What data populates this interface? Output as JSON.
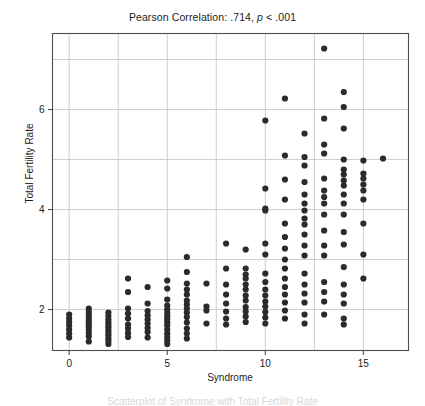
{
  "figure": {
    "title_prefix": "Pearson Correlation: .714, ",
    "title_stat_italic": "p",
    "title_suffix": " < .001",
    "title_full": "Pearson Correlation: .714, p < .001",
    "caption_fragment": "Scatterplot of Syndrome with Total Fertility Rate",
    "background_color": "#ffffff",
    "frame_color": "#4d4d4d",
    "grid_color": "#c9c9c9",
    "point_color": "#2b2b2b"
  },
  "chart_data": {
    "type": "scatter",
    "title": "Pearson Correlation: .714, p < .001",
    "xlabel": "Syndrome",
    "ylabel": "Total Fertility Rate",
    "xlim": [
      -0.85,
      17.3
    ],
    "ylim": [
      1.18,
      7.52
    ],
    "xticks": [
      0,
      5,
      10,
      15
    ],
    "xtick_labels": [
      "0",
      "5",
      "10",
      "15"
    ],
    "yticks": [
      2,
      4,
      6
    ],
    "ytick_labels": [
      "2",
      "4",
      "6"
    ],
    "grid": true,
    "grid_x_minor": [
      2.5,
      7.5,
      12.5
    ],
    "grid_y_minor": [
      3,
      5,
      7
    ],
    "legend": null,
    "pearson_r": 0.714,
    "p_value": "< .001",
    "n_points": 186,
    "marker": "circle",
    "marker_size": 3.1,
    "points": [
      [
        0,
        1.9
      ],
      [
        0,
        1.82
      ],
      [
        0,
        1.75
      ],
      [
        0,
        1.68
      ],
      [
        0,
        1.6
      ],
      [
        0,
        1.52
      ],
      [
        0,
        1.44
      ],
      [
        1,
        2.02
      ],
      [
        1,
        1.95
      ],
      [
        1,
        1.88
      ],
      [
        1,
        1.83
      ],
      [
        1,
        1.77
      ],
      [
        1,
        1.72
      ],
      [
        1,
        1.66
      ],
      [
        1,
        1.6
      ],
      [
        1,
        1.53
      ],
      [
        1,
        1.46
      ],
      [
        1,
        1.36
      ],
      [
        2,
        1.94
      ],
      [
        2,
        1.87
      ],
      [
        2,
        1.8
      ],
      [
        2,
        1.74
      ],
      [
        2,
        1.69
      ],
      [
        2,
        1.64
      ],
      [
        2,
        1.58
      ],
      [
        2,
        1.53
      ],
      [
        2,
        1.48
      ],
      [
        2,
        1.42
      ],
      [
        2,
        1.37
      ],
      [
        2,
        1.31
      ],
      [
        3,
        2.62
      ],
      [
        3,
        2.35
      ],
      [
        3,
        2.02
      ],
      [
        3,
        1.92
      ],
      [
        3,
        1.82
      ],
      [
        3,
        1.7
      ],
      [
        3,
        1.62
      ],
      [
        3,
        1.53
      ],
      [
        3,
        1.45
      ],
      [
        4,
        2.45
      ],
      [
        4,
        2.12
      ],
      [
        4,
        1.97
      ],
      [
        4,
        1.88
      ],
      [
        4,
        1.8
      ],
      [
        4,
        1.72
      ],
      [
        4,
        1.63
      ],
      [
        4,
        1.55
      ],
      [
        4,
        1.44
      ],
      [
        5,
        2.58
      ],
      [
        5,
        2.42
      ],
      [
        5,
        2.2
      ],
      [
        5,
        2.08
      ],
      [
        5,
        2.0
      ],
      [
        5,
        1.93
      ],
      [
        5,
        1.86
      ],
      [
        5,
        1.8
      ],
      [
        5,
        1.74
      ],
      [
        5,
        1.68
      ],
      [
        5,
        1.6
      ],
      [
        5,
        1.52
      ],
      [
        5,
        1.45
      ],
      [
        5,
        1.38
      ],
      [
        5,
        1.31
      ],
      [
        6,
        3.05
      ],
      [
        6,
        2.75
      ],
      [
        6,
        2.52
      ],
      [
        6,
        2.4
      ],
      [
        6,
        2.3
      ],
      [
        6,
        2.18
      ],
      [
        6,
        2.1
      ],
      [
        6,
        2.02
      ],
      [
        6,
        1.94
      ],
      [
        6,
        1.85
      ],
      [
        6,
        1.74
      ],
      [
        6,
        1.62
      ],
      [
        6,
        1.52
      ],
      [
        6,
        1.42
      ],
      [
        7,
        2.52
      ],
      [
        7,
        2.06
      ],
      [
        7,
        1.98
      ],
      [
        7,
        1.72
      ],
      [
        8,
        3.32
      ],
      [
        8,
        2.82
      ],
      [
        8,
        2.5
      ],
      [
        8,
        2.3
      ],
      [
        8,
        2.12
      ],
      [
        8,
        1.96
      ],
      [
        8,
        1.82
      ],
      [
        8,
        1.7
      ],
      [
        9,
        3.2
      ],
      [
        9,
        2.82
      ],
      [
        9,
        2.7
      ],
      [
        9,
        2.62
      ],
      [
        9,
        2.5
      ],
      [
        9,
        2.4
      ],
      [
        9,
        2.28
      ],
      [
        9,
        2.18
      ],
      [
        9,
        2.05
      ],
      [
        9,
        1.96
      ],
      [
        9,
        1.86
      ],
      [
        9,
        1.75
      ],
      [
        10,
        5.78
      ],
      [
        10,
        4.42
      ],
      [
        10,
        4.02
      ],
      [
        10,
        3.98
      ],
      [
        10,
        3.32
      ],
      [
        10,
        3.1
      ],
      [
        10,
        2.72
      ],
      [
        10,
        2.55
      ],
      [
        10,
        2.4
      ],
      [
        10,
        2.28
      ],
      [
        10,
        2.16
      ],
      [
        10,
        2.06
      ],
      [
        10,
        1.95
      ],
      [
        10,
        1.84
      ],
      [
        10,
        1.72
      ],
      [
        11,
        6.22
      ],
      [
        11,
        5.08
      ],
      [
        11,
        4.6
      ],
      [
        11,
        4.2
      ],
      [
        11,
        3.72
      ],
      [
        11,
        3.45
      ],
      [
        11,
        3.22
      ],
      [
        11,
        3.0
      ],
      [
        11,
        2.82
      ],
      [
        11,
        2.62
      ],
      [
        11,
        2.45
      ],
      [
        11,
        2.3
      ],
      [
        11,
        2.14
      ],
      [
        11,
        1.98
      ],
      [
        11,
        1.82
      ],
      [
        12,
        5.52
      ],
      [
        12,
        5.05
      ],
      [
        12,
        4.88
      ],
      [
        12,
        4.55
      ],
      [
        12,
        4.3
      ],
      [
        12,
        4.12
      ],
      [
        12,
        3.98
      ],
      [
        12,
        3.82
      ],
      [
        12,
        3.7
      ],
      [
        12,
        3.5
      ],
      [
        12,
        3.28
      ],
      [
        12,
        3.08
      ],
      [
        12,
        2.72
      ],
      [
        12,
        2.5
      ],
      [
        12,
        2.32
      ],
      [
        12,
        2.14
      ],
      [
        12,
        1.9
      ],
      [
        12,
        1.72
      ],
      [
        13,
        7.22
      ],
      [
        13,
        5.82
      ],
      [
        13,
        5.3
      ],
      [
        13,
        5.12
      ],
      [
        13,
        4.62
      ],
      [
        13,
        4.38
      ],
      [
        13,
        4.25
      ],
      [
        13,
        4.12
      ],
      [
        13,
        3.9
      ],
      [
        13,
        3.58
      ],
      [
        13,
        3.28
      ],
      [
        13,
        3.08
      ],
      [
        13,
        2.55
      ],
      [
        13,
        2.35
      ],
      [
        13,
        2.16
      ],
      [
        13,
        1.9
      ],
      [
        14,
        6.35
      ],
      [
        14,
        6.05
      ],
      [
        14,
        5.62
      ],
      [
        14,
        5.0
      ],
      [
        14,
        4.8
      ],
      [
        14,
        4.7
      ],
      [
        14,
        4.58
      ],
      [
        14,
        4.48
      ],
      [
        14,
        4.3
      ],
      [
        14,
        4.12
      ],
      [
        14,
        3.9
      ],
      [
        14,
        3.55
      ],
      [
        14,
        3.3
      ],
      [
        14,
        2.85
      ],
      [
        14,
        2.5
      ],
      [
        14,
        2.3
      ],
      [
        14,
        2.12
      ],
      [
        14,
        1.82
      ],
      [
        14,
        1.7
      ],
      [
        15,
        4.98
      ],
      [
        15,
        4.72
      ],
      [
        15,
        4.62
      ],
      [
        15,
        4.5
      ],
      [
        15,
        4.38
      ],
      [
        15,
        4.2
      ],
      [
        15,
        3.72
      ],
      [
        15,
        3.1
      ],
      [
        15,
        2.62
      ],
      [
        16,
        5.02
      ]
    ]
  }
}
